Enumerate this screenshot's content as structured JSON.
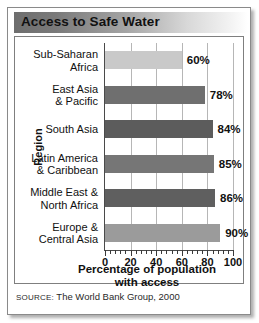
{
  "figure": {
    "title": "Access to Safe Water",
    "source_keyword": "SOURCE:",
    "source_text": "The World Bank Group, 2000"
  },
  "chart_data": {
    "type": "bar",
    "orientation": "horizontal",
    "title": "Access to Safe Water",
    "xlabel": "Percentage of population with access",
    "xlabel_line1": "Percentage of population",
    "xlabel_line2": "with access",
    "ylabel": "Region",
    "xlim": [
      0,
      100
    ],
    "xticks": [
      0,
      20,
      40,
      60,
      80,
      100
    ],
    "xtick_labels": [
      "0",
      "20",
      "40",
      "60",
      "80",
      "100"
    ],
    "minor_tick_interval": 4,
    "grid": true,
    "grid_axis": "x",
    "legend": false,
    "categories": [
      "Sub-Saharan Africa",
      "East Asia & Pacific",
      "South Asia",
      "Latin America & Caribbean",
      "Middle East & North Africa",
      "Europe & Central Asia"
    ],
    "values": [
      60,
      78,
      84,
      85,
      86,
      90
    ],
    "data_labels": [
      "60%",
      "78%",
      "84%",
      "85%",
      "86%",
      "90%"
    ],
    "bar_colors": [
      "#c9c9c9",
      "#6f6f6f",
      "#5c5c5c",
      "#767676",
      "#5f5f5f",
      "#9b9b9b"
    ],
    "bars": [
      {
        "label_line1": "Sub-Saharan",
        "label_line2": "Africa",
        "value": 60,
        "data_label": "60%",
        "color": "#c9c9c9"
      },
      {
        "label_line1": "East Asia",
        "label_line2": "& Pacific",
        "value": 78,
        "data_label": "78%",
        "color": "#6f6f6f"
      },
      {
        "label_line1": "South Asia",
        "label_line2": "",
        "value": 84,
        "data_label": "84%",
        "color": "#5c5c5c"
      },
      {
        "label_line1": "Latin America",
        "label_line2": "& Caribbean",
        "value": 85,
        "data_label": "85%",
        "color": "#767676"
      },
      {
        "label_line1": "Middle East &",
        "label_line2": "North Africa",
        "value": 86,
        "data_label": "86%",
        "color": "#5f5f5f"
      },
      {
        "label_line1": "Europe &",
        "label_line2": "Central Asia",
        "value": 90,
        "data_label": "90%",
        "color": "#9b9b9b"
      }
    ]
  },
  "colors": {
    "title_bar_dark": "#6e6e6e",
    "frame": "#8a8a8a",
    "gridline": "#b6b6b6",
    "axis": "#4a4a4a",
    "text": "#111111"
  }
}
